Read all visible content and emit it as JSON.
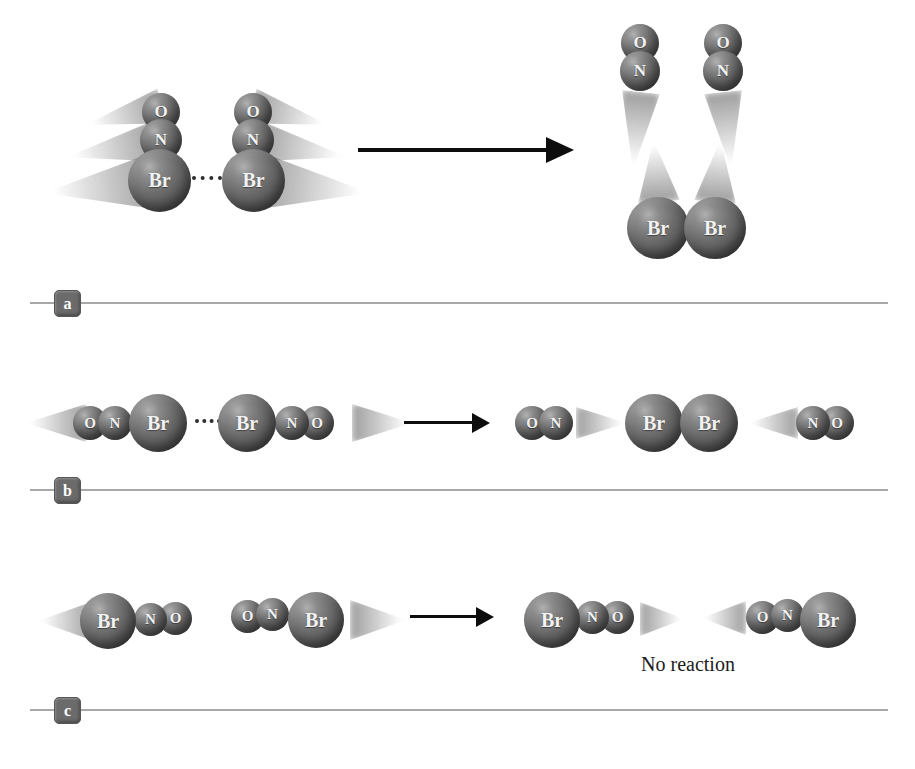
{
  "atom_labels": {
    "O": "O",
    "N": "N",
    "Br": "Br"
  },
  "panels": {
    "a": {
      "label": "a"
    },
    "b": {
      "label": "b"
    },
    "c": {
      "label": "c",
      "annotation": "No reaction"
    }
  },
  "colors": {
    "background": "#ffffff",
    "sphere_mid": "#6e6e6e",
    "sphere_highlight": "#b0b0b0",
    "sphere_shadow": "#373737",
    "atom_text": "#f2f2f2",
    "trail": "#8d8d8d",
    "arrow": "#0d0d0d",
    "separator_line": "#a8a8a8",
    "panel_label_bg": "#6b6b6b",
    "panel_label_text": "#ffffff",
    "annotation_text": "#1b1b1b",
    "dotted_bond": "#2e2e2e"
  }
}
